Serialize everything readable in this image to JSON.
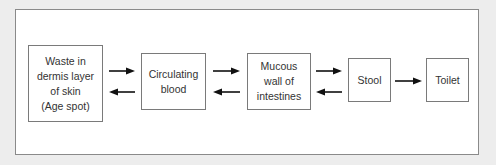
{
  "diagram": {
    "nodes": [
      {
        "id": "waste",
        "label": "Waste in\ndermis layer\nof skin\n(Age spot)"
      },
      {
        "id": "blood",
        "label": "Circulating\nblood"
      },
      {
        "id": "mucous",
        "label": "Mucous\nwall of\nintestines"
      },
      {
        "id": "stool",
        "label": "Stool"
      },
      {
        "id": "toilet",
        "label": "Toilet"
      }
    ],
    "edges": [
      {
        "from": "waste",
        "to": "blood",
        "bidirectional": true
      },
      {
        "from": "blood",
        "to": "mucous",
        "bidirectional": true
      },
      {
        "from": "mucous",
        "to": "stool",
        "bidirectional": true
      },
      {
        "from": "stool",
        "to": "toilet",
        "bidirectional": false
      }
    ],
    "colors": {
      "background": "#ededed",
      "frame": "#ffffff",
      "border": "#7a7a7a",
      "arrow": "#111111",
      "text": "#333333"
    }
  }
}
